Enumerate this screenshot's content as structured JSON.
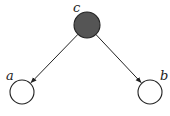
{
  "diagram": {
    "type": "directed-graphical-model",
    "nodes": [
      {
        "id": "c",
        "label": "c",
        "cx": 87,
        "cy": 25,
        "r": 13,
        "observed": true,
        "fill": "#555555",
        "label_x": 73,
        "label_y": 12
      },
      {
        "id": "a",
        "label": "a",
        "cx": 22,
        "cy": 92,
        "r": 12,
        "observed": false,
        "fill": "#ffffff",
        "label_x": 6,
        "label_y": 80
      },
      {
        "id": "b",
        "label": "b",
        "cx": 150,
        "cy": 92,
        "r": 12,
        "observed": false,
        "fill": "#ffffff",
        "label_x": 160,
        "label_y": 80
      }
    ],
    "edges": [
      {
        "from": "c",
        "to": "a"
      },
      {
        "from": "c",
        "to": "b"
      }
    ],
    "colors": {
      "stroke": "#222222",
      "observed_fill": "#555555"
    }
  }
}
